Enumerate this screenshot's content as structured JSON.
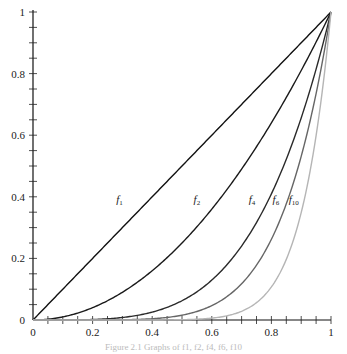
{
  "chart_data": {
    "type": "line",
    "title": "",
    "xlabel": "",
    "ylabel": "",
    "xlim": [
      0,
      1
    ],
    "ylim": [
      0,
      1
    ],
    "grid": false,
    "x_ticks": [
      0,
      0.2,
      0.4,
      0.6,
      0.8,
      1
    ],
    "x_tick_labels": [
      "0",
      "0.2",
      "0.4",
      "0.6",
      "0.8",
      "1"
    ],
    "y_ticks": [
      0,
      0.2,
      0.4,
      0.6,
      0.8,
      1
    ],
    "y_tick_labels": [
      "0",
      "0.2",
      "0.4",
      "0.6",
      "0.8",
      "1"
    ],
    "minor_tick_step": 0.05,
    "series": [
      {
        "name": "f1",
        "label_base": "f",
        "label_sub": "1",
        "exponent": 1,
        "color": "#111111",
        "label_x": 0.29,
        "label_y": 0.38,
        "x": [
          0,
          0.2,
          0.4,
          0.6,
          0.8,
          1
        ],
        "values": [
          0,
          0.2,
          0.4,
          0.6,
          0.8,
          1
        ]
      },
      {
        "name": "f2",
        "label_base": "f",
        "label_sub": "2",
        "exponent": 2,
        "color": "#1a1a1a",
        "label_x": 0.55,
        "label_y": 0.38,
        "x": [
          0,
          0.2,
          0.4,
          0.6,
          0.8,
          1
        ],
        "values": [
          0,
          0.04,
          0.16,
          0.36,
          0.64,
          1
        ]
      },
      {
        "name": "f4",
        "label_base": "f",
        "label_sub": "4",
        "exponent": 4,
        "color": "#2a2a2a",
        "label_x": 0.735,
        "label_y": 0.38,
        "x": [
          0,
          0.2,
          0.4,
          0.6,
          0.8,
          1
        ],
        "values": [
          0,
          0.0016,
          0.0256,
          0.1296,
          0.4096,
          1
        ]
      },
      {
        "name": "f6",
        "label_base": "f",
        "label_sub": "6",
        "exponent": 6,
        "color": "#666666",
        "label_x": 0.815,
        "label_y": 0.38,
        "x": [
          0,
          0.2,
          0.4,
          0.6,
          0.8,
          1
        ],
        "values": [
          0,
          6.4e-05,
          0.004096,
          0.046656,
          0.262144,
          1
        ]
      },
      {
        "name": "f10",
        "label_base": "f",
        "label_sub": "10",
        "exponent": 10,
        "color": "#b5b5b5",
        "label_x": 0.875,
        "label_y": 0.38,
        "x": [
          0,
          0.2,
          0.4,
          0.6,
          0.8,
          1
        ],
        "values": [
          0,
          1e-07,
          0.000105,
          0.006047,
          0.107374,
          1
        ]
      }
    ]
  },
  "caption": "Figure 2.1  Graphs of f1, f2, f4, f6, f10"
}
